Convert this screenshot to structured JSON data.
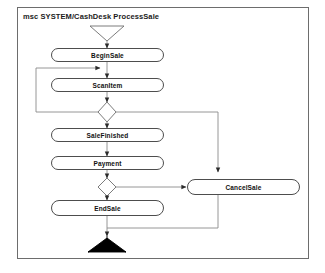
{
  "diagram": {
    "title": "msc SYSTEM/CashDesk ProcessSale",
    "type": "activity-diagram",
    "frame_label_prefix": "msc",
    "colors": {
      "frame_border": "#6d6d6d",
      "node_border": "#4d4d4d",
      "node_fill": "#ffffff",
      "connector": "#8a8a8a",
      "end_symbol_fill": "#000000",
      "background": "#ffffff",
      "text": "#111111"
    },
    "nodes": [
      {
        "id": "start",
        "label": "",
        "shape": "start-triangle"
      },
      {
        "id": "beginsale",
        "label": "BeginSale",
        "shape": "rounded-rect"
      },
      {
        "id": "scanitem",
        "label": "ScanItem",
        "shape": "rounded-rect"
      },
      {
        "id": "decision1",
        "label": "",
        "shape": "diamond"
      },
      {
        "id": "salefinished",
        "label": "SaleFinished",
        "shape": "rounded-rect"
      },
      {
        "id": "payment",
        "label": "Payment",
        "shape": "rounded-rect"
      },
      {
        "id": "decision2",
        "label": "",
        "shape": "diamond"
      },
      {
        "id": "endsale",
        "label": "EndSale",
        "shape": "rounded-rect"
      },
      {
        "id": "cancelsale",
        "label": "CancelSale",
        "shape": "rounded-rect"
      },
      {
        "id": "end",
        "label": "",
        "shape": "end-triangle-filled"
      }
    ],
    "edges": [
      {
        "from": "start",
        "to": "beginsale",
        "label": ""
      },
      {
        "from": "beginsale",
        "to": "scanitem",
        "label": ""
      },
      {
        "from": "scanitem",
        "to": "decision1",
        "label": ""
      },
      {
        "from": "decision1",
        "to": "scanitem",
        "label": ""
      },
      {
        "from": "decision1",
        "to": "salefinished",
        "label": ""
      },
      {
        "from": "decision1",
        "to": "cancelsale",
        "label": ""
      },
      {
        "from": "salefinished",
        "to": "payment",
        "label": ""
      },
      {
        "from": "payment",
        "to": "decision2",
        "label": ""
      },
      {
        "from": "decision2",
        "to": "endsale",
        "label": ""
      },
      {
        "from": "decision2",
        "to": "cancelsale",
        "label": ""
      },
      {
        "from": "endsale",
        "to": "end",
        "label": ""
      },
      {
        "from": "cancelsale",
        "to": "end",
        "label": ""
      }
    ]
  }
}
